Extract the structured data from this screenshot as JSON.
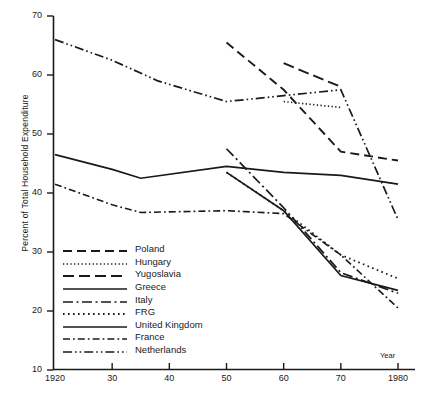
{
  "chart_data": {
    "type": "line",
    "title": "",
    "xlabel": "Year",
    "ylabel": "Percent of Total Household Expenditure",
    "xlim": [
      1920,
      1980
    ],
    "ylim": [
      10,
      70
    ],
    "xticks": [
      1920,
      1930,
      1940,
      1950,
      1960,
      1970,
      1980
    ],
    "xtick_labels": [
      "1920",
      "30",
      "40",
      "50",
      "60",
      "70",
      "1980"
    ],
    "yticks": [
      10,
      20,
      30,
      40,
      50,
      60,
      70
    ],
    "ytick_labels": [
      "10",
      "20",
      "30",
      "40",
      "50",
      "60",
      "70"
    ],
    "grid": false,
    "legend_position": "lower-left-inside",
    "series": [
      {
        "name": "Poland",
        "style": "dashed",
        "x": [
          1950,
          1960,
          1970,
          1980
        ],
        "values": [
          65.5,
          57.5,
          47.0,
          45.5
        ]
      },
      {
        "name": "Hungary",
        "style": "dotted",
        "x": [
          1960,
          1970
        ],
        "values": [
          55.5,
          54.5
        ]
      },
      {
        "name": "Yugoslavia",
        "style": "long-dashed",
        "x": [
          1960,
          1970
        ],
        "values": [
          62.0,
          58.0
        ]
      },
      {
        "name": "Greece",
        "style": "solid",
        "x": [
          1950,
          1960,
          1970,
          1980
        ],
        "values": [
          43.5,
          37.0,
          26.0,
          23.5
        ]
      },
      {
        "name": "Italy",
        "style": "dash-dot",
        "x": [
          1950,
          1960,
          1970,
          1980
        ],
        "values": [
          47.5,
          37.5,
          26.5,
          23.0
        ]
      },
      {
        "name": "FRG",
        "style": "densely-dotted",
        "x": [
          1950,
          1960,
          1970,
          1980
        ],
        "values": [
          43.5,
          37.0,
          29.5,
          25.5
        ]
      },
      {
        "name": "United Kingdom",
        "style": "solid",
        "x": [
          1920,
          1930,
          1935,
          1950,
          1960,
          1970,
          1980
        ],
        "values": [
          46.5,
          44.0,
          42.5,
          44.5,
          43.5,
          43.0,
          41.5
        ]
      },
      {
        "name": "France",
        "style": "dash-dot-short",
        "x": [
          1920,
          1930,
          1935,
          1950,
          1960,
          1970,
          1980
        ],
        "values": [
          41.5,
          38.0,
          36.7,
          37.0,
          36.5,
          29.5,
          20.5
        ]
      },
      {
        "name": "Netherlands",
        "style": "dash-dot-dot",
        "x": [
          1920,
          1930,
          1938,
          1950,
          1960,
          1970,
          1980
        ],
        "values": [
          66.0,
          62.5,
          59.0,
          55.5,
          56.5,
          57.5,
          35.5
        ]
      }
    ]
  },
  "legend": {
    "items": [
      {
        "label": "Poland",
        "key": "dashed"
      },
      {
        "label": "Hungary",
        "key": "dotted"
      },
      {
        "label": "Yugoslavia",
        "key": "long-dashed"
      },
      {
        "label": "Greece",
        "key": "solid"
      },
      {
        "label": "Italy",
        "key": "dash-dot"
      },
      {
        "label": "FRG",
        "key": "densely-dotted"
      },
      {
        "label": "United Kingdom",
        "key": "solid"
      },
      {
        "label": "France",
        "key": "dash-dot-short"
      },
      {
        "label": "Netherlands",
        "key": "dash-dot-dot"
      }
    ]
  }
}
